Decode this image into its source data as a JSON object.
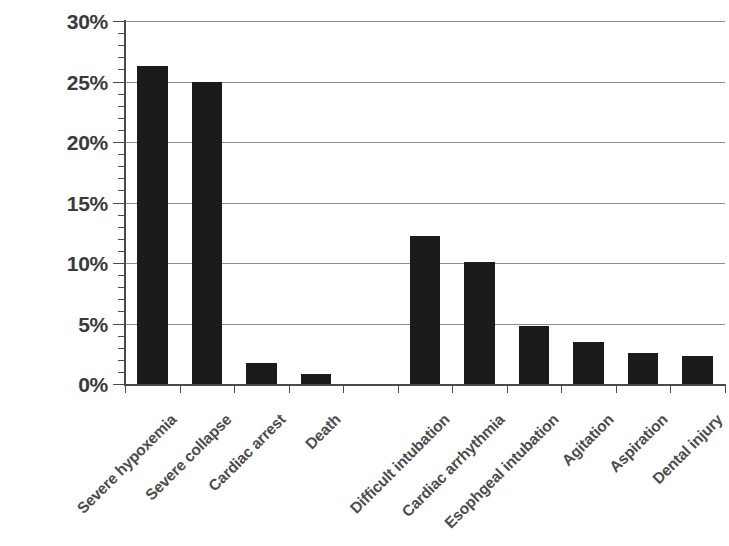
{
  "chart_data": {
    "type": "bar",
    "title": "",
    "subtitle": "",
    "xlabel": "",
    "ylabel": "",
    "categories": [
      "Severe hypoxemia",
      "Severe collapse",
      "Cardiac arrest",
      "Death",
      "",
      "Difficult intubation",
      "Cardiac arrhythmia",
      "Esophgeal intubation",
      "Agitation",
      "Aspiration",
      "Dental injury"
    ],
    "values": [
      26.3,
      25.0,
      1.7,
      0.8,
      null,
      12.2,
      10.1,
      4.8,
      3.5,
      2.6,
      2.3
    ],
    "value_labels": [
      "26.3%",
      "25.0%",
      "1.7%",
      "0.8%",
      "",
      "12.2%",
      "10.1%",
      "4.8%",
      "3.5%",
      "2.6%",
      "2.3%"
    ],
    "ylim": [
      0,
      30
    ],
    "ytick_values": [
      0,
      5,
      10,
      15,
      20,
      25,
      30
    ],
    "ytick_labels": [
      "0%",
      "5%",
      "10%",
      "15%",
      "20%",
      "25%",
      "30%"
    ],
    "y_minor_tick_step": 1,
    "grid": "horizontal",
    "legend": "none",
    "bar_color": "#1b1b1b",
    "grid_color": "#8d8d8d",
    "axis_color": "#4a4a4a",
    "label_color": "#4c4c4c",
    "tick_label_color": "#3a3a3a",
    "background_color": "#ffffff",
    "xlabel_rotation_deg": -45,
    "annotations": []
  }
}
